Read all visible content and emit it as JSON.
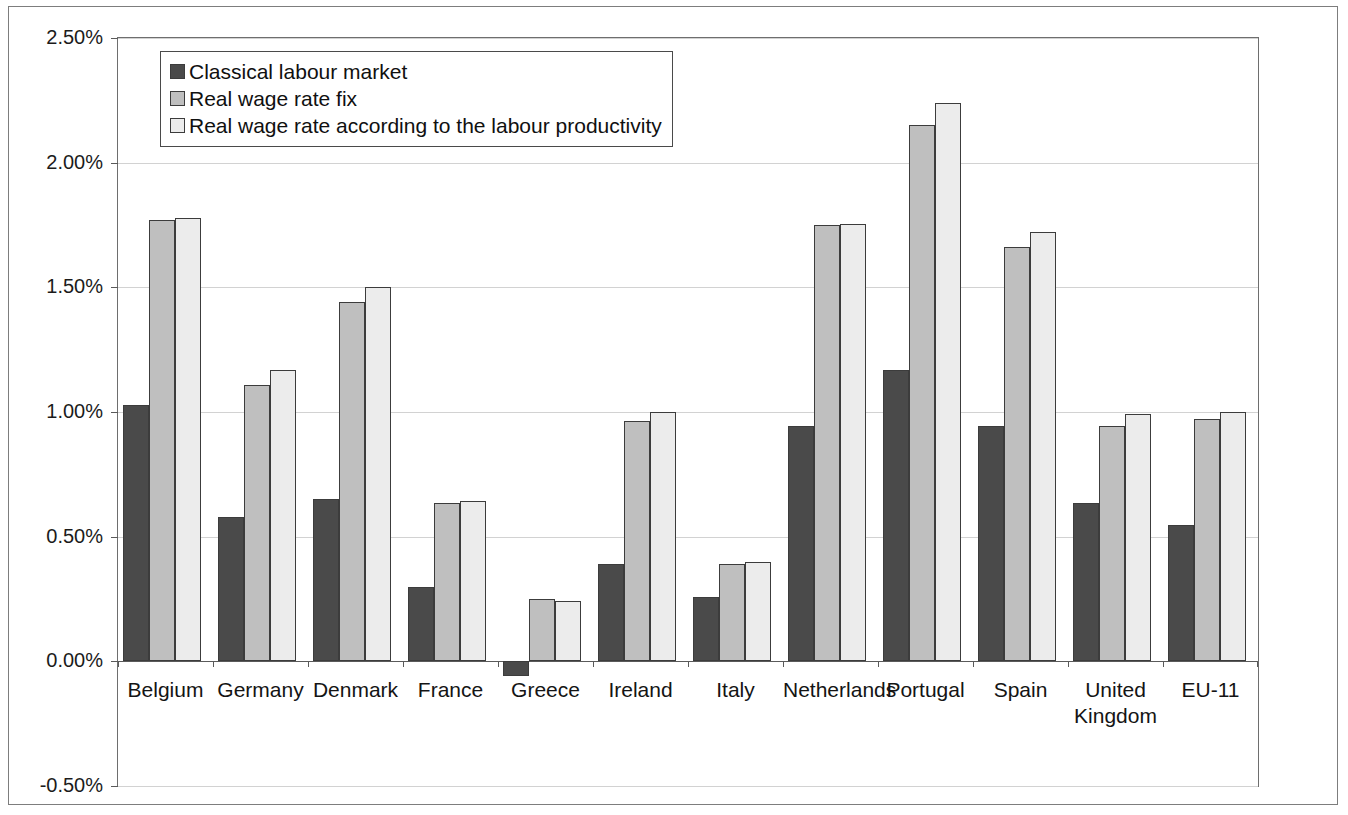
{
  "chart_data": {
    "type": "bar",
    "title": "",
    "subtitle": "",
    "xlabel": "",
    "ylabel": "",
    "grid": true,
    "legend_position": "top-left",
    "ylim": [
      -0.5,
      2.5
    ],
    "ytick_labels": [
      "2.50%",
      "2.00%",
      "1.50%",
      "1.00%",
      "0.50%",
      "0.00%",
      "-0.50%"
    ],
    "ytick_values": [
      2.5,
      2.0,
      1.5,
      1.0,
      0.5,
      0.0,
      -0.5
    ],
    "categories": [
      "Belgium",
      "Germany",
      "Denmark",
      "France",
      "Greece",
      "Ireland",
      "Italy",
      "Netherlands",
      "Portugal",
      "Spain",
      "United\nKingdom",
      "EU-11"
    ],
    "series": [
      {
        "name": "Classical labour market",
        "color": "#4a4a4a",
        "values": [
          1.03,
          0.58,
          0.65,
          0.3,
          -0.06,
          0.39,
          0.26,
          0.945,
          1.17,
          0.945,
          0.635,
          0.545
        ]
      },
      {
        "name": "Real wage rate fix",
        "color": "#bfbfbf",
        "values": [
          1.77,
          1.11,
          1.44,
          0.635,
          0.25,
          0.965,
          0.39,
          1.75,
          2.15,
          1.66,
          0.945,
          0.97
        ]
      },
      {
        "name": "Real wage rate according to the labour productivity",
        "color": "#ececec",
        "values": [
          1.78,
          1.17,
          1.5,
          0.645,
          0.24,
          1.0,
          0.4,
          1.755,
          2.24,
          1.72,
          0.99,
          1.0
        ]
      }
    ]
  },
  "legend": {
    "items": [
      {
        "label": "Classical labour market"
      },
      {
        "label": "Real wage rate fix"
      },
      {
        "label": "Real wage rate according to the labour productivity"
      }
    ]
  }
}
